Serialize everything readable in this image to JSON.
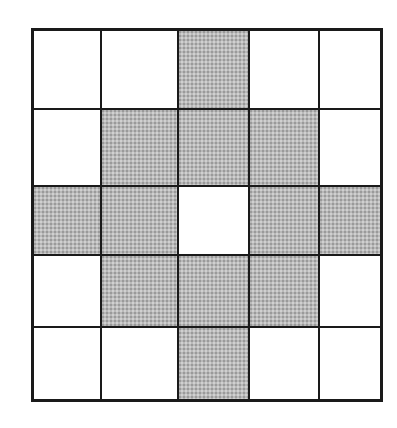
{
  "diagram": {
    "type": "grid",
    "rows": 5,
    "columns": 5,
    "colors": {
      "shaded": "#b9b9b9",
      "empty": "#ffffff",
      "border": "#1a1a1a"
    },
    "cells": [
      [
        "empty",
        "empty",
        "shaded",
        "empty",
        "empty"
      ],
      [
        "empty",
        "shaded",
        "shaded",
        "shaded",
        "empty"
      ],
      [
        "shaded",
        "shaded",
        "empty",
        "shaded",
        "shaded"
      ],
      [
        "empty",
        "shaded",
        "shaded",
        "shaded",
        "empty"
      ],
      [
        "empty",
        "empty",
        "shaded",
        "empty",
        "empty"
      ]
    ],
    "shaded_count": 12
  }
}
